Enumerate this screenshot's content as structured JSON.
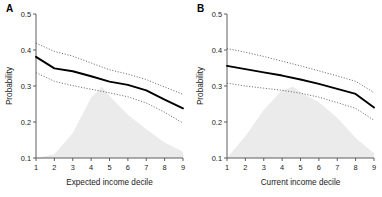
{
  "figure": {
    "background": "#ffffff",
    "line_color": "#000000",
    "ci_color": "#555555",
    "density_color": "#ebebeb",
    "axis_color": "#4d4d4d",
    "text_color": "#1a1a1a"
  },
  "panels": [
    {
      "label": "A",
      "xlabel": "Expected income decile",
      "ylabel": "Probability"
    },
    {
      "label": "B",
      "xlabel": "Current income decile",
      "ylabel": "Probability"
    }
  ],
  "chart_data": [
    {
      "type": "line",
      "title": "A",
      "xlabel": "Expected income decile",
      "ylabel": "Probability",
      "xlim": [
        1,
        9
      ],
      "ylim": [
        0.1,
        0.5
      ],
      "xticks": [
        1,
        2,
        3,
        4,
        5,
        6,
        7,
        8,
        9
      ],
      "xticklabels": [
        "1",
        "2",
        "3",
        "4",
        "5",
        "6",
        "7",
        "8",
        "9"
      ],
      "yticks": [
        0.1,
        0.2,
        0.3,
        0.4,
        0.5
      ],
      "yticklabels": [
        "0.1",
        "0.2",
        "0.3",
        "0.4",
        "0.5"
      ],
      "grid": false,
      "legend": "none",
      "x": [
        1,
        2,
        3,
        4,
        5,
        6,
        7,
        8,
        9
      ],
      "series": [
        {
          "name": "Predicted probability",
          "style": "solid",
          "values": [
            0.381,
            0.349,
            0.341,
            0.327,
            0.312,
            0.303,
            0.288,
            0.262,
            0.238
          ]
        },
        {
          "name": "Upper 95% CI",
          "style": "dotted",
          "values": [
            0.419,
            0.396,
            0.383,
            0.364,
            0.345,
            0.333,
            0.318,
            0.297,
            0.277
          ]
        },
        {
          "name": "Lower 95% CI",
          "style": "dotted",
          "values": [
            0.337,
            0.313,
            0.301,
            0.291,
            0.281,
            0.27,
            0.253,
            0.227,
            0.197
          ]
        }
      ],
      "density": {
        "name": "Sample distribution",
        "x": [
          1,
          2,
          3,
          4,
          4.6,
          5,
          6,
          7,
          8,
          9
        ],
        "values": [
          0.0,
          0.05,
          0.32,
          0.78,
          0.92,
          0.8,
          0.56,
          0.37,
          0.2,
          0.08
        ]
      }
    },
    {
      "type": "line",
      "title": "B",
      "xlabel": "Current income decile",
      "ylabel": "Probability",
      "xlim": [
        1,
        9
      ],
      "ylim": [
        0.1,
        0.5
      ],
      "xticks": [
        1,
        2,
        3,
        4,
        5,
        6,
        7,
        8,
        9
      ],
      "xticklabels": [
        "1",
        "2",
        "3",
        "4",
        "5",
        "6",
        "7",
        "8",
        "9"
      ],
      "yticks": [
        0.1,
        0.2,
        0.3,
        0.4,
        0.5
      ],
      "yticklabels": [
        "0.1",
        "0.2",
        "0.3",
        "0.4",
        "0.5"
      ],
      "grid": false,
      "legend": "none",
      "x": [
        1,
        2,
        3,
        4,
        5,
        6,
        7,
        8,
        9
      ],
      "series": [
        {
          "name": "Predicted probability",
          "style": "solid",
          "values": [
            0.356,
            0.347,
            0.338,
            0.329,
            0.318,
            0.306,
            0.292,
            0.278,
            0.24
          ]
        },
        {
          "name": "Upper 95% CI",
          "style": "dotted",
          "values": [
            0.404,
            0.394,
            0.382,
            0.369,
            0.356,
            0.342,
            0.328,
            0.313,
            0.282
          ]
        },
        {
          "name": "Lower 95% CI",
          "style": "dotted",
          "values": [
            0.308,
            0.3,
            0.294,
            0.288,
            0.28,
            0.269,
            0.254,
            0.238,
            0.205
          ]
        }
      ],
      "density": {
        "name": "Sample distribution",
        "x": [
          1,
          2,
          3,
          4,
          4.6,
          5,
          6,
          7,
          8,
          9
        ],
        "values": [
          0.0,
          0.28,
          0.62,
          0.88,
          0.92,
          0.85,
          0.72,
          0.52,
          0.26,
          0.06
        ]
      }
    }
  ]
}
